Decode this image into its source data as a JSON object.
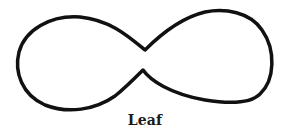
{
  "figure": {
    "caption": "Leaf",
    "shape": "leaf-curve",
    "stroke_color": "#111111",
    "background_color": "#ffffff"
  }
}
